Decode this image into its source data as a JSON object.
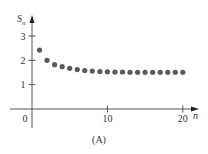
{
  "chart_data": {
    "type": "scatter",
    "title": "",
    "caption": "(A)",
    "xlabel": "n",
    "ylabel": "S",
    "ylabel_subscript": "n",
    "xlim": [
      0,
      21
    ],
    "ylim": [
      0,
      3.4
    ],
    "x_ticks": [
      0,
      10,
      20
    ],
    "x_tick_labels": [
      "0",
      "10",
      "20"
    ],
    "y_ticks": [
      1,
      2,
      3
    ],
    "y_tick_labels": [
      "1",
      "2",
      "3"
    ],
    "grid": false,
    "legend": null,
    "series": [
      {
        "name": "S_n",
        "color": "#5a5a5a",
        "x": [
          1,
          2,
          3,
          4,
          5,
          6,
          7,
          8,
          9,
          10,
          11,
          12,
          13,
          14,
          15,
          16,
          17,
          18,
          19,
          20
        ],
        "values": [
          2.42,
          2.0,
          1.82,
          1.74,
          1.67,
          1.62,
          1.58,
          1.56,
          1.54,
          1.53,
          1.52,
          1.52,
          1.51,
          1.51,
          1.51,
          1.51,
          1.51,
          1.51,
          1.51,
          1.51
        ]
      }
    ]
  },
  "colors": {
    "axis": "#444444",
    "dots": "#5a5a5a",
    "text": "#333333"
  }
}
